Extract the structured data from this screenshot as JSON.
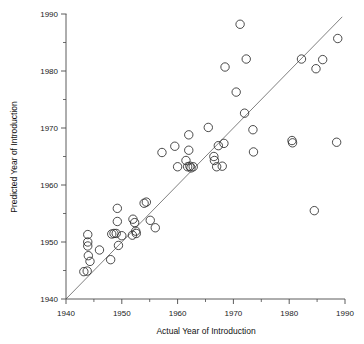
{
  "chart_data": {
    "type": "scatter",
    "title": "",
    "xlabel": "Actual Year of Introduction",
    "ylabel": "Predicted Year of Introduction",
    "xlim": [
      1938,
      1992
    ],
    "ylim": [
      1938,
      1992
    ],
    "grid": false,
    "legend": null,
    "x_ticks": [
      1940,
      1950,
      1960,
      1970,
      1980,
      1990
    ],
    "y_ticks": [
      1940,
      1950,
      1960,
      1970,
      1980,
      1990
    ],
    "x_tick_labels": [
      "1940",
      "1950",
      "1960",
      "1970",
      "1980",
      "1990"
    ],
    "y_tick_labels": [
      "1940",
      "1950",
      "1960",
      "1970",
      "1980",
      "1990"
    ],
    "x_minor_ticks": [
      1945,
      1955,
      1965,
      1975,
      1985
    ],
    "y_minor_ticks": [
      1945,
      1955,
      1965,
      1975,
      1985
    ],
    "marker": "open-circle",
    "marker_size": 4.2,
    "reference_line": {
      "name": "identity-line",
      "type": "y=x",
      "from": [
        1940,
        1940
      ],
      "to": [
        1989.5,
        1989.5
      ]
    },
    "series": [
      {
        "name": "Technologies",
        "points": [
          [
            1943.2,
            1944.8
          ],
          [
            1943.8,
            1944.9
          ],
          [
            1943.9,
            1951.3
          ],
          [
            1943.9,
            1950.0
          ],
          [
            1943.9,
            1949.3
          ],
          [
            1944.0,
            1947.6
          ],
          [
            1944.3,
            1946.6
          ],
          [
            1946.0,
            1948.6
          ],
          [
            1948.0,
            1946.9
          ],
          [
            1948.2,
            1951.4
          ],
          [
            1948.6,
            1951.5
          ],
          [
            1949.0,
            1951.5
          ],
          [
            1949.2,
            1955.9
          ],
          [
            1949.2,
            1953.6
          ],
          [
            1949.4,
            1949.4
          ],
          [
            1950.0,
            1951.1
          ],
          [
            1951.9,
            1951.2
          ],
          [
            1952.0,
            1954.0
          ],
          [
            1952.3,
            1953.4
          ],
          [
            1952.5,
            1951.9
          ],
          [
            1952.6,
            1951.5
          ],
          [
            1954.0,
            1956.8
          ],
          [
            1954.4,
            1957.0
          ],
          [
            1955.1,
            1953.8
          ],
          [
            1956.0,
            1952.5
          ],
          [
            1957.2,
            1965.7
          ],
          [
            1959.5,
            1966.8
          ],
          [
            1960.0,
            1963.2
          ],
          [
            1961.5,
            1964.3
          ],
          [
            1961.8,
            1963.2
          ],
          [
            1962.0,
            1968.8
          ],
          [
            1962.0,
            1966.1
          ],
          [
            1962.2,
            1963.3
          ],
          [
            1962.4,
            1963.0
          ],
          [
            1962.8,
            1963.2
          ],
          [
            1965.5,
            1970.1
          ],
          [
            1966.5,
            1965.0
          ],
          [
            1966.6,
            1964.3
          ],
          [
            1967.0,
            1963.2
          ],
          [
            1967.3,
            1666.9
          ],
          [
            1967.3,
            1966.9
          ],
          [
            1968.0,
            1963.3
          ],
          [
            1968.3,
            1967.3
          ],
          [
            1968.5,
            1980.7
          ],
          [
            1970.5,
            1976.3
          ],
          [
            1971.2,
            1988.2
          ],
          [
            1972.0,
            1972.6
          ],
          [
            1972.3,
            1982.1
          ],
          [
            1973.5,
            1969.7
          ],
          [
            1973.6,
            1965.8
          ],
          [
            1980.5,
            1967.8
          ],
          [
            1980.6,
            1967.4
          ],
          [
            1982.2,
            1982.1
          ],
          [
            1984.5,
            1955.5
          ],
          [
            1984.8,
            1980.4
          ],
          [
            1986.0,
            1982.0
          ],
          [
            1988.5,
            1967.5
          ],
          [
            1988.7,
            1985.7
          ]
        ]
      }
    ]
  },
  "axes": {
    "x_axis_name": "x-axis",
    "y_axis_name": "y-axis"
  }
}
